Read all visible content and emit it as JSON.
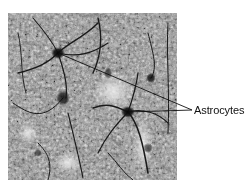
{
  "figure": {
    "type": "micrograph",
    "colors": {
      "background": "#ffffff",
      "tissue_base": "#9a9a9a",
      "stain_dark": "#1a1a1a",
      "stain_light": "#e6e6e6",
      "leader_line": "#111111",
      "label_text": "#111111"
    },
    "annotations": [
      {
        "label": "Astrocytes",
        "targets": [
          {
            "name": "astrocyte-1",
            "x": 58,
            "y": 53
          },
          {
            "name": "astrocyte-2",
            "x": 128,
            "y": 112
          }
        ],
        "label_anchor": {
          "x": 192,
          "y": 110
        }
      }
    ]
  }
}
